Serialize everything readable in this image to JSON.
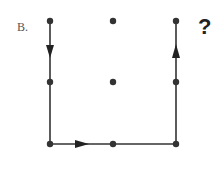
{
  "diagram": {
    "label": "B.",
    "question_mark": "?",
    "grid": {
      "columns_x": [
        50,
        113,
        176
      ],
      "rows_y": [
        21,
        82,
        144
      ]
    },
    "dots": [
      {
        "x": 50,
        "y": 21
      },
      {
        "x": 113,
        "y": 21
      },
      {
        "x": 176,
        "y": 21
      },
      {
        "x": 50,
        "y": 82
      },
      {
        "x": 113,
        "y": 82
      },
      {
        "x": 176,
        "y": 82
      },
      {
        "x": 50,
        "y": 144
      },
      {
        "x": 113,
        "y": 144
      },
      {
        "x": 176,
        "y": 144
      }
    ],
    "path": [
      {
        "from": [
          50,
          21
        ],
        "to": [
          50,
          144
        ],
        "arrow_direction": "down"
      },
      {
        "from": [
          50,
          144
        ],
        "to": [
          176,
          144
        ],
        "arrow_direction": "right"
      },
      {
        "from": [
          176,
          144
        ],
        "to": [
          176,
          21
        ],
        "arrow_direction": "up"
      }
    ],
    "colors": {
      "line": "#333333",
      "dot": "#333333",
      "background": "#ffffff"
    }
  }
}
